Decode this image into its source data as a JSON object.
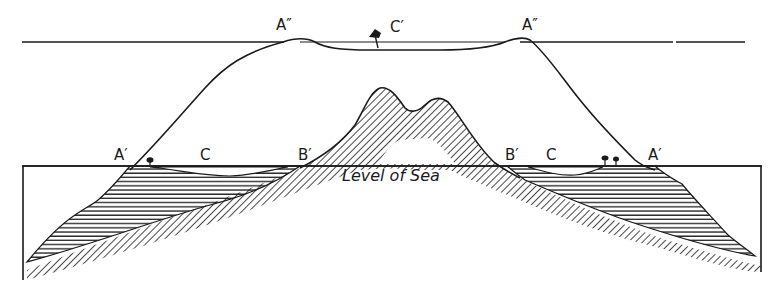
{
  "diagram": {
    "type": "geological-cross-section",
    "colors": {
      "ink": "#1a1a1a",
      "paper": "#ffffff"
    },
    "labels": {
      "a_double_prime_left": "A″",
      "a_double_prime_right": "A″",
      "c_prime": "C′",
      "a_prime_left": "A′",
      "c_left": "C",
      "b_prime_left": "B′",
      "b_prime_right": "B′",
      "c_right": "C",
      "a_prime_right": "A′",
      "sea_level": "Level of Sea"
    },
    "icons": [
      "tree-icon",
      "tree-icon",
      "tree-icon"
    ]
  }
}
